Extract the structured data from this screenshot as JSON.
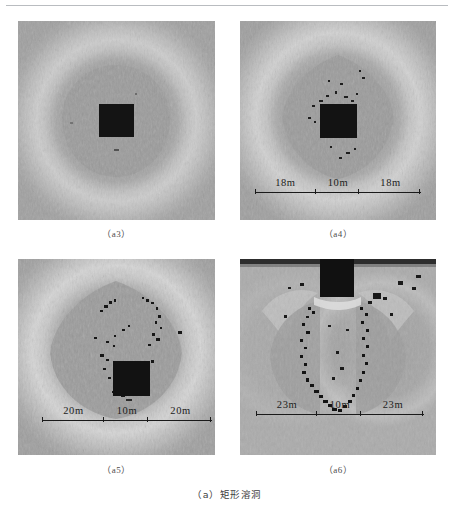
{
  "figure": {
    "caption": "（a）矩形溶洞",
    "panels": [
      {
        "id": "a3",
        "label": "（a3）",
        "has_scalebar": false,
        "scalebar": {
          "left": "",
          "middle": "",
          "right": ""
        }
      },
      {
        "id": "a4",
        "label": "（a4）",
        "has_scalebar": true,
        "scalebar": {
          "left": "18m",
          "middle": "10m",
          "right": "18m"
        }
      },
      {
        "id": "a5",
        "label": "（a5）",
        "has_scalebar": true,
        "scalebar": {
          "left": "20m",
          "middle": "10m",
          "right": "20m"
        }
      },
      {
        "id": "a6",
        "label": "（a6）",
        "has_scalebar": true,
        "scalebar": {
          "left": "23m",
          "middle": "10m",
          "right": "23m"
        }
      }
    ]
  },
  "colors": {
    "page_background": "#ffffff",
    "rule": "#b9bcc0",
    "field_gray": "#9a9a9a",
    "inner_gray": "#9c9c9c",
    "halo_light": "#c8c8c8",
    "cavity_black": "#121212",
    "caption_text": "#3e3e3e",
    "scale_text": "#1c1c1c"
  }
}
